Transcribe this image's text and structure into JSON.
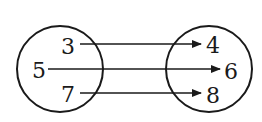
{
  "diagram": {
    "type": "mapping",
    "domain": {
      "elements": [
        {
          "label": "3",
          "x": 68,
          "y": 46
        },
        {
          "label": "5",
          "x": 39,
          "y": 70
        },
        {
          "label": "7",
          "x": 68,
          "y": 94
        }
      ],
      "circle": {
        "cx": 60,
        "cy": 69,
        "r": 43
      }
    },
    "range": {
      "elements": [
        {
          "label": "4",
          "x": 213,
          "y": 45
        },
        {
          "label": "6",
          "x": 231,
          "y": 71
        },
        {
          "label": "8",
          "x": 213,
          "y": 95
        }
      ],
      "circle": {
        "cx": 209,
        "cy": 69,
        "r": 43
      }
    },
    "mappings": [
      {
        "from": "3",
        "to": "4"
      },
      {
        "from": "5",
        "to": "6"
      },
      {
        "from": "7",
        "to": "8"
      }
    ],
    "stroke_color": "#1a1a1a"
  }
}
